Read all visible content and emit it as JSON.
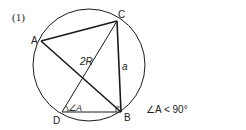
{
  "figure_number": "(1)",
  "points": {
    "A": {
      "label": "A",
      "x": 41,
      "y": 41
    },
    "B": {
      "label": "B",
      "x": 121,
      "y": 112
    },
    "C": {
      "label": "C",
      "x": 117,
      "y": 21
    },
    "D": {
      "label": "D",
      "x": 62,
      "y": 112
    }
  },
  "circle": {
    "cx": 89,
    "cy": 65,
    "r": 56
  },
  "labels": {
    "diameter": "2R",
    "side": "a",
    "angle_at_D": "∠A",
    "condition": "∠A < 90°"
  },
  "colors": {
    "stroke": "#1a1a1a",
    "background": "#ffffff"
  }
}
